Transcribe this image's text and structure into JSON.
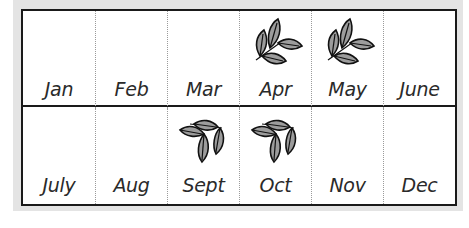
{
  "calendar": {
    "rows": [
      {
        "months": [
          {
            "label": "Jan",
            "icon": null
          },
          {
            "label": "Feb",
            "icon": null
          },
          {
            "label": "Mar",
            "icon": null
          },
          {
            "label": "Apr",
            "icon": "leaf-sprig-icon"
          },
          {
            "label": "May",
            "icon": "leaf-sprig-icon"
          },
          {
            "label": "June",
            "icon": null
          }
        ]
      },
      {
        "months": [
          {
            "label": "July",
            "icon": null
          },
          {
            "label": "Aug",
            "icon": null
          },
          {
            "label": "Sept",
            "icon": "leaf-sprig-falling-icon"
          },
          {
            "label": "Oct",
            "icon": "leaf-sprig-falling-icon"
          },
          {
            "label": "Nov",
            "icon": null
          },
          {
            "label": "Dec",
            "icon": null
          }
        ]
      }
    ],
    "colors": {
      "border": "#1a1a1a",
      "leaf_fill": "#9c9c9c",
      "background_panel": "#e4e4e4",
      "divider": "#9a9a9a"
    }
  }
}
